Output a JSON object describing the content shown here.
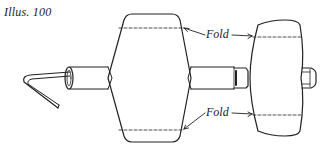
{
  "caption": "Illus. 100",
  "labels": {
    "fold_top": "Fold",
    "fold_bottom": "Fold"
  },
  "colors": {
    "ink": "#222222",
    "background": "#ffffff"
  },
  "parts": [
    "bent-wire-handle",
    "shaft",
    "large-drum",
    "small-drum",
    "shaft-end-cap"
  ]
}
